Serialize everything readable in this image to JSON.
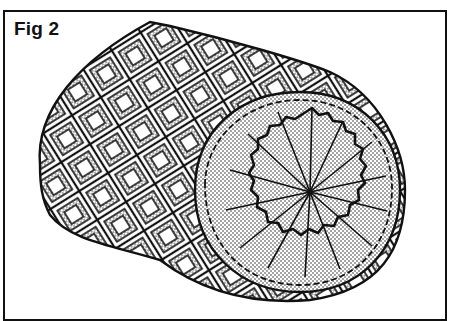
{
  "figure": {
    "label": "Fig 2",
    "colors": {
      "ink": "#111111",
      "paper": "#ffffff",
      "stipple": "#333333"
    },
    "end_face": {
      "radial_line_count": 14,
      "fill": "stippled"
    },
    "side_pattern": "diamond lattice, alternating stippled and open squares"
  }
}
